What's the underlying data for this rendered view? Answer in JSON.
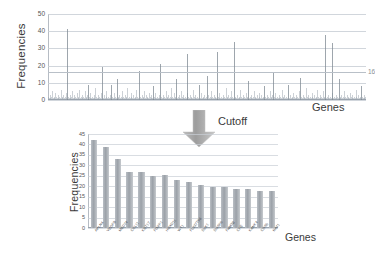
{
  "figure": {
    "cutoff_label": "Cutoff",
    "arrow_icon": "arrow-down-icon",
    "arrow_color": "#a6a6a6"
  },
  "chart_data": [
    {
      "id": "top",
      "type": "bar",
      "title": "",
      "xlabel": "Genes",
      "ylabel": "Frequencies",
      "ylim": [
        0,
        50
      ],
      "yticks": [
        0,
        10,
        20,
        30,
        40,
        50
      ],
      "grid": true,
      "legend": "none",
      "annotations": [
        {
          "text": "16",
          "value": 16,
          "note": "cutoff frequency line"
        }
      ],
      "note": "Genome-wide per-gene mutation frequencies; dense thin spikes, most near zero",
      "categories": [],
      "values": [
        2,
        1,
        3,
        1,
        2,
        5,
        1,
        2,
        1,
        4,
        2,
        1,
        3,
        1,
        2,
        1,
        6,
        2,
        1,
        3,
        1,
        2,
        1,
        4,
        41,
        2,
        1,
        3,
        1,
        2,
        5,
        1,
        3,
        1,
        2,
        1,
        4,
        2,
        1,
        6,
        1,
        2,
        3,
        1,
        2,
        1,
        5,
        2,
        1,
        3,
        9,
        2,
        1,
        4,
        1,
        2,
        1,
        3,
        1,
        7,
        2,
        1,
        3,
        1,
        2,
        1,
        4,
        19,
        2,
        1,
        3,
        1,
        2,
        5,
        1,
        2,
        1,
        3,
        1,
        9,
        2,
        1,
        4,
        1,
        2,
        1,
        12,
        2,
        1,
        3,
        1,
        2,
        1,
        5,
        2,
        1,
        3,
        1,
        2,
        7,
        1,
        2,
        1,
        4,
        2,
        1,
        3,
        1,
        2,
        1,
        6,
        2,
        1,
        17,
        1,
        2,
        1,
        3,
        1,
        2,
        5,
        1,
        3,
        1,
        2,
        1,
        4,
        2,
        1,
        3,
        1,
        8,
        2,
        1,
        4,
        1,
        2,
        1,
        3,
        1,
        21,
        2,
        1,
        3,
        1,
        2,
        1,
        5,
        2,
        1,
        3,
        1,
        2,
        1,
        7,
        2,
        1,
        4,
        1,
        2,
        12,
        1,
        2,
        1,
        3,
        1,
        5,
        2,
        1,
        3,
        1,
        2,
        1,
        4,
        27,
        2,
        1,
        3,
        1,
        2,
        1,
        6,
        2,
        1,
        3,
        1,
        2,
        1,
        9,
        2,
        1,
        4,
        1,
        2,
        1,
        3,
        1,
        2,
        14,
        1,
        3,
        1,
        2,
        1,
        5,
        2,
        1,
        3,
        1,
        2,
        1,
        28,
        2,
        1,
        4,
        1,
        2,
        1,
        3,
        1,
        2,
        1,
        7,
        2,
        1,
        3,
        1,
        2,
        1,
        5,
        2,
        1,
        34,
        1,
        2,
        1,
        3,
        1,
        2,
        1,
        6,
        2,
        1,
        3,
        1,
        2,
        1,
        4,
        2,
        1,
        11,
        1,
        2,
        1,
        3,
        1,
        2,
        5,
        1,
        2,
        1,
        3,
        1,
        4,
        2,
        1,
        3,
        1,
        2,
        1,
        8,
        2,
        1,
        3,
        1,
        2,
        1,
        5,
        2,
        1,
        3,
        16,
        2,
        1,
        4,
        1,
        2,
        1,
        3,
        1,
        2,
        1,
        6,
        2,
        1,
        3,
        1,
        2,
        1,
        9,
        2,
        1,
        3,
        1,
        2,
        1,
        4,
        2,
        1,
        3,
        1,
        2,
        1,
        5,
        13,
        1,
        2,
        1,
        3,
        1,
        2,
        1,
        7,
        2,
        1,
        3,
        1,
        2,
        1,
        4,
        2,
        1,
        3,
        1,
        2,
        1,
        6,
        2,
        1,
        3,
        1,
        2,
        1,
        5,
        2,
        1,
        38,
        1,
        2,
        1,
        3,
        1,
        2,
        1,
        4,
        33,
        1,
        2,
        1,
        3,
        1,
        2,
        1,
        12,
        2,
        1,
        3,
        1,
        2,
        1,
        5,
        2,
        1,
        3,
        1,
        2,
        1,
        4,
        2,
        1,
        3,
        1,
        2,
        1,
        6,
        2,
        1,
        3,
        1,
        2,
        1,
        8,
        2,
        1,
        3,
        1,
        2
      ]
    },
    {
      "id": "bottom",
      "type": "bar",
      "title": "",
      "xlabel": "Genes",
      "ylabel": "Frequencies",
      "ylim": [
        0,
        45
      ],
      "yticks": [
        0,
        5,
        10,
        15,
        20,
        25,
        30,
        35,
        40,
        45
      ],
      "grid": true,
      "legend": "none",
      "note": "Genes above the cutoff of 16, sorted by descending frequency",
      "categories": [
        "APLN4",
        "VEGFB",
        "MED24",
        "CCL11",
        "KRT17",
        "FOXP1",
        "HOXD11",
        "WT1",
        "FLJ37796",
        "DLK1",
        "DUSP5",
        "FAM3B",
        "CPE",
        "KANK4",
        "CDS5",
        "NAT1"
      ],
      "values": [
        42,
        39,
        33,
        27,
        27,
        25,
        25.5,
        23,
        22,
        20.5,
        19.5,
        19.5,
        18.5,
        18.5,
        17.5,
        17.5
      ]
    }
  ]
}
